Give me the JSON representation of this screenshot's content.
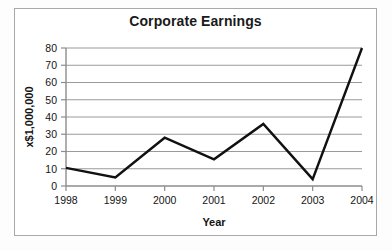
{
  "chart_data": {
    "type": "line",
    "title": "Corporate Earnings",
    "xlabel": "Year",
    "ylabel": "x$1,000,000",
    "categories": [
      "1998",
      "1999",
      "2000",
      "2001",
      "2002",
      "2003",
      "2004"
    ],
    "values": [
      10.5,
      5,
      28,
      15.5,
      36,
      4,
      80
    ],
    "series": [
      {
        "name": "Corporate Earnings",
        "values": [
          10.5,
          5,
          28,
          15.5,
          36,
          4,
          80
        ]
      }
    ],
    "x": [
      1998,
      1999,
      2000,
      2001,
      2002,
      2003,
      2004
    ],
    "ylim": [
      0,
      80
    ],
    "ytick_labels": [
      "0",
      "10",
      "20",
      "30",
      "40",
      "50",
      "60",
      "70",
      "80"
    ],
    "ytick_values": [
      0,
      10,
      20,
      30,
      40,
      50,
      60,
      70,
      80
    ],
    "xtick_labels": [
      "1998",
      "1999",
      "2000",
      "2001",
      "2002",
      "2003",
      "2004"
    ],
    "grid": true,
    "legend": false,
    "legend_position": "none",
    "line_color": "#111111",
    "grid_color": "#9a9a9a",
    "axis_color": "#8c8c8c",
    "frame_color": "#a8a8a8",
    "background_color": "#ffffff"
  }
}
